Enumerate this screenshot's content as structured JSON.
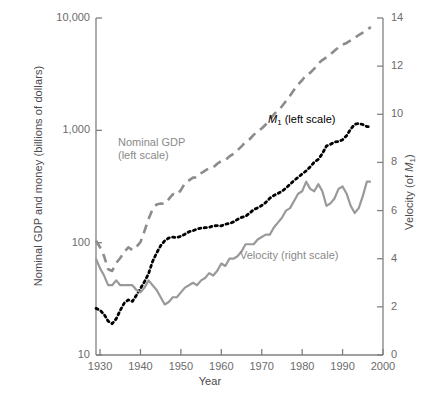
{
  "chart_data": {
    "type": "line",
    "title": "",
    "xlabel": "Year",
    "ylabel_left": "Nominal GDP and money (billions of dollars)",
    "ylabel_right": "Velocity (of M₁)",
    "xlim": [
      1929,
      2000
    ],
    "xticks": [
      1930,
      1940,
      1950,
      1960,
      1970,
      1980,
      1990,
      2000
    ],
    "xticklabels": [
      "1930",
      "1940",
      "1950",
      "1960",
      "1970",
      "1980",
      "1990",
      "2000"
    ],
    "left_axis": {
      "scale": "log",
      "ylim": [
        10,
        10000
      ],
      "yticks": [
        10,
        100,
        1000,
        10000
      ],
      "yticklabels": [
        "10",
        "100",
        "1,000",
        "10,000"
      ]
    },
    "right_axis": {
      "scale": "linear",
      "ylim": [
        0,
        14
      ],
      "yticks": [
        0,
        2,
        4,
        6,
        8,
        10,
        12,
        14
      ],
      "yticklabels": [
        "0",
        "2",
        "4",
        "6",
        "8",
        "10",
        "12",
        "14"
      ]
    },
    "grid": false,
    "legend_position": "inline-annotations",
    "colors": {
      "nominal_gdp": "#8c8c8c",
      "m1": "#000000",
      "velocity": "#999999",
      "axis": "#808080",
      "tick_text": "#6b6b6b",
      "axis_title": "#4a4a4a"
    },
    "series": [
      {
        "name": "Nominal GDP (left scale)",
        "label": "Nominal GDP",
        "label_line2": "(left scale)",
        "axis": "left",
        "style": "dashed",
        "color": "#8c8c8c",
        "x": [
          1929,
          1930,
          1931,
          1932,
          1933,
          1934,
          1935,
          1936,
          1937,
          1938,
          1939,
          1940,
          1941,
          1942,
          1943,
          1944,
          1945,
          1946,
          1947,
          1948,
          1949,
          1950,
          1951,
          1952,
          1953,
          1954,
          1955,
          1956,
          1957,
          1958,
          1959,
          1960,
          1961,
          1962,
          1963,
          1964,
          1965,
          1966,
          1967,
          1968,
          1969,
          1970,
          1971,
          1972,
          1973,
          1974,
          1975,
          1976,
          1977,
          1978,
          1979,
          1980,
          1981,
          1982,
          1983,
          1984,
          1985,
          1986,
          1987,
          1988,
          1989,
          1990,
          1991,
          1992,
          1993,
          1994,
          1995,
          1996,
          1997
        ],
        "y": [
          104,
          91,
          76,
          58,
          56,
          66,
          73,
          83,
          91,
          86,
          92,
          101,
          127,
          162,
          199,
          219,
          223,
          222,
          244,
          270,
          267,
          294,
          339,
          358,
          379,
          380,
          415,
          438,
          461,
          468,
          504,
          534,
          546,
          586,
          618,
          664,
          719,
          788,
          833,
          910,
          985,
          1039,
          1128,
          1241,
          1385,
          1501,
          1636,
          1824,
          2031,
          2295,
          2563,
          2790,
          3128,
          3255,
          3537,
          3933,
          4220,
          4463,
          4740,
          5104,
          5484,
          5803,
          5996,
          6318,
          6642,
          7054,
          7401,
          7813,
          8319
        ]
      },
      {
        "name": "M1 (left scale)",
        "label": "M₁ (left scale)",
        "axis": "left",
        "style": "dotted",
        "color": "#000000",
        "x": [
          1929,
          1930,
          1931,
          1932,
          1933,
          1934,
          1935,
          1936,
          1937,
          1938,
          1939,
          1940,
          1941,
          1942,
          1943,
          1944,
          1945,
          1946,
          1947,
          1948,
          1949,
          1950,
          1951,
          1952,
          1953,
          1954,
          1955,
          1956,
          1957,
          1958,
          1959,
          1960,
          1961,
          1962,
          1963,
          1964,
          1965,
          1966,
          1967,
          1968,
          1969,
          1970,
          1971,
          1972,
          1973,
          1974,
          1975,
          1976,
          1977,
          1978,
          1979,
          1980,
          1981,
          1982,
          1983,
          1984,
          1985,
          1986,
          1987,
          1988,
          1989,
          1990,
          1991,
          1992,
          1993,
          1994,
          1995,
          1996,
          1997
        ],
        "y": [
          26,
          25,
          23,
          20,
          19,
          21,
          25,
          29,
          31,
          30,
          34,
          39,
          45,
          53,
          68,
          81,
          94,
          104,
          110,
          112,
          111,
          114,
          119,
          125,
          128,
          132,
          135,
          136,
          137,
          141,
          142,
          141,
          146,
          148,
          153,
          161,
          168,
          172,
          183,
          197,
          204,
          214,
          228,
          249,
          263,
          274,
          287,
          306,
          331,
          358,
          382,
          409,
          436,
          474,
          521,
          552,
          620,
          725,
          750,
          787,
          794,
          826,
          897,
          1025,
          1130,
          1150,
          1127,
          1081,
          1073
        ]
      },
      {
        "name": "Velocity (right scale)",
        "label": "Velocity (right scale)",
        "axis": "right",
        "style": "solid",
        "color": "#999999",
        "x": [
          1929,
          1930,
          1931,
          1932,
          1933,
          1934,
          1935,
          1936,
          1937,
          1938,
          1939,
          1940,
          1941,
          1942,
          1943,
          1944,
          1945,
          1946,
          1947,
          1948,
          1949,
          1950,
          1951,
          1952,
          1953,
          1954,
          1955,
          1956,
          1957,
          1958,
          1959,
          1960,
          1961,
          1962,
          1963,
          1964,
          1965,
          1966,
          1967,
          1968,
          1969,
          1970,
          1971,
          1972,
          1973,
          1974,
          1975,
          1976,
          1977,
          1978,
          1979,
          1980,
          1981,
          1982,
          1983,
          1984,
          1985,
          1986,
          1987,
          1988,
          1989,
          1990,
          1991,
          1992,
          1993,
          1994,
          1995,
          1996,
          1997
        ],
        "y": [
          4.0,
          3.6,
          3.3,
          2.9,
          2.9,
          3.1,
          2.9,
          2.9,
          2.9,
          2.9,
          2.7,
          2.6,
          2.8,
          3.1,
          2.9,
          2.7,
          2.4,
          2.1,
          2.2,
          2.4,
          2.4,
          2.6,
          2.8,
          2.9,
          3.0,
          2.9,
          3.1,
          3.2,
          3.4,
          3.3,
          3.5,
          3.8,
          3.7,
          4.0,
          4.0,
          4.1,
          4.3,
          4.6,
          4.6,
          4.6,
          4.8,
          4.9,
          5.0,
          5.0,
          5.3,
          5.5,
          5.7,
          6.0,
          6.1,
          6.4,
          6.7,
          6.8,
          7.2,
          6.9,
          6.8,
          7.1,
          6.8,
          6.2,
          6.3,
          6.5,
          6.9,
          7.0,
          6.7,
          6.2,
          5.9,
          6.1,
          6.6,
          7.2,
          7.2
        ]
      }
    ]
  },
  "annotations": {
    "gdp_line1": "Nominal GDP",
    "gdp_line2": "(left scale)",
    "m1_prefix": "M",
    "m1_sub": "1",
    "m1_suffix": " (left scale)",
    "velocity": "Velocity (right scale)"
  },
  "axis_titles": {
    "left_main": "Nominal GDP and money (billions of dollars)",
    "right_prefix": "Velocity (of ",
    "right_italic": "M",
    "right_sub": "1",
    "right_suffix": ")",
    "x": "Year"
  }
}
